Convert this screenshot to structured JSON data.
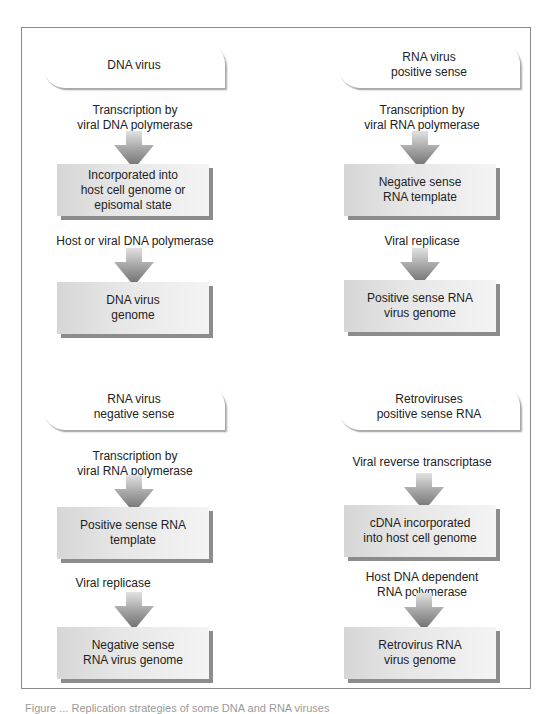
{
  "diagram": {
    "type": "flowchart",
    "columns": [
      {
        "id": "dna-virus",
        "start": "DNA virus",
        "steps": [
          {
            "label": "Transcription by\nviral DNA polymerase",
            "result": "Incorporated into\nhost cell genome or\nepisomal state"
          },
          {
            "label": "Host or viral DNA polymerase",
            "result": "DNA virus\ngenome"
          }
        ]
      },
      {
        "id": "rna-virus-positive",
        "start": "RNA virus\npositive sense",
        "steps": [
          {
            "label": "Transcription by\nviral RNA polymerase",
            "result": "Negative sense\nRNA template"
          },
          {
            "label": "Viral replicase",
            "result": "Positive sense RNA\nvirus genome"
          }
        ]
      },
      {
        "id": "rna-virus-negative",
        "start": "RNA virus\nnegative sense",
        "steps": [
          {
            "label": "Transcription by\nviral RNA polymerase",
            "result": "Positive sense RNA\ntemplate"
          },
          {
            "label": "Viral replicase",
            "result": "Negative sense\nRNA virus genome"
          }
        ]
      },
      {
        "id": "retroviruses",
        "start": "Retroviruses\npositive sense RNA",
        "steps": [
          {
            "label": "Viral reverse transcriptase",
            "result": "cDNA incorporated\ninto host cell genome"
          },
          {
            "label": "Host DNA dependent\nRNA polymerase",
            "result": "Retrovirus RNA\nvirus genome"
          }
        ]
      }
    ]
  },
  "tl": {
    "start_1": "DNA virus",
    "label_1a": "Transcription by",
    "label_1b": "viral DNA polymerase",
    "box_1a": "Incorporated into",
    "box_1b": "host cell genome or",
    "box_1c": "episomal state",
    "label_2": "Host or viral DNA polymerase",
    "box_2a": "DNA virus",
    "box_2b": "genome"
  },
  "tr": {
    "start_a": "RNA virus",
    "start_b": "positive sense",
    "label_1a": "Transcription by",
    "label_1b": "viral RNA polymerase",
    "box_1a": "Negative sense",
    "box_1b": "RNA template",
    "label_2": "Viral replicase",
    "box_2a": "Positive sense RNA",
    "box_2b": "virus genome"
  },
  "bl": {
    "start_a": "RNA virus",
    "start_b": "negative sense",
    "label_1a": "Transcription by",
    "label_1b": "viral RNA polymerase",
    "box_1a": "Positive sense RNA",
    "box_1b": "template",
    "label_2": "Viral replicase",
    "box_2a": "Negative sense",
    "box_2b": "RNA virus genome"
  },
  "br": {
    "start_a": "Retroviruses",
    "start_b": "positive sense RNA",
    "label_1": "Viral reverse transcriptase",
    "box_1a": "cDNA incorporated",
    "box_1b": "into host cell genome",
    "label_2a": "Host DNA dependent",
    "label_2b": "RNA polymerase",
    "box_2a": "Retrovirus RNA",
    "box_2b": "virus genome"
  },
  "caption": "Figure ... Replication strategies of some DNA and RNA viruses",
  "colors": {
    "frame_border": "#8a8a8a",
    "box_fill_light": "#f4f4f4",
    "box_fill_dark": "#d6d6d6",
    "box_shadow": "#8c8c8c",
    "arrow_top": "#d8d8d8",
    "arrow_tip": "#6e6e6e",
    "text": "#222222"
  }
}
